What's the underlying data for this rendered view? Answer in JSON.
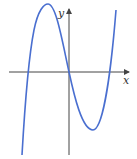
{
  "figure": {
    "type": "function-graph",
    "axes": {
      "x_label": "x",
      "y_label": "y",
      "axis_color": "#444444"
    },
    "curve": {
      "color": "#4a6fd0",
      "shape": "cubic",
      "roots": [
        "negative",
        "0",
        "positive"
      ],
      "features": [
        "local maximum left of y-axis",
        "local minimum right of y-axis"
      ]
    }
  }
}
